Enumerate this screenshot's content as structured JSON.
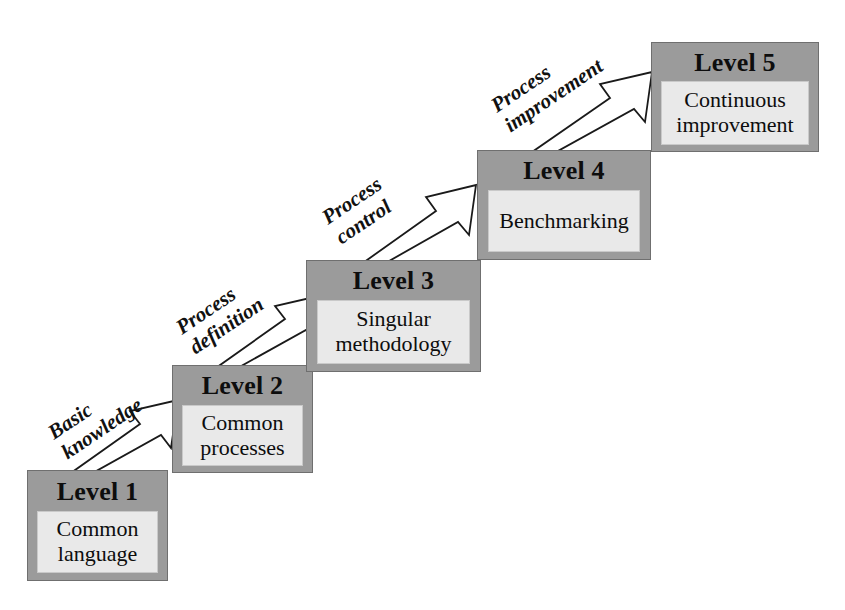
{
  "diagram": {
    "type": "maturity-model-staircase",
    "background_color": "#ffffff",
    "box_header_color": "#9b9b9b",
    "box_panel_color": "#e9e9e9",
    "box_border_color": "#6f6f6f",
    "text_color": "#0d0d0d",
    "arrow_fill": "#ffffff",
    "arrow_stroke": "#111111"
  },
  "levels": [
    {
      "id": "level-1",
      "title": "Level 1",
      "description_lines": [
        "Common",
        "language"
      ]
    },
    {
      "id": "level-2",
      "title": "Level 2",
      "description_lines": [
        "Common",
        "processes"
      ]
    },
    {
      "id": "level-3",
      "title": "Level 3",
      "description_lines": [
        "Singular",
        "methodology"
      ]
    },
    {
      "id": "level-4",
      "title": "Level 4",
      "description_lines": [
        "Benchmarking"
      ]
    },
    {
      "id": "level-5",
      "title": "Level 5",
      "description_lines": [
        "Continuous",
        "improvement"
      ]
    }
  ],
  "transitions": [
    {
      "id": "transition-1",
      "from": "Level 1",
      "to": "Level 2",
      "label_lines": [
        "Basic",
        "knowledge"
      ]
    },
    {
      "id": "transition-2",
      "from": "Level 2",
      "to": "Level 3",
      "label_lines": [
        "Process",
        "definition"
      ]
    },
    {
      "id": "transition-3",
      "from": "Level 3",
      "to": "Level 4",
      "label_lines": [
        "Process",
        "control"
      ]
    },
    {
      "id": "transition-4",
      "from": "Level 4",
      "to": "Level 5",
      "label_lines": [
        "Process",
        "improvement"
      ]
    }
  ]
}
